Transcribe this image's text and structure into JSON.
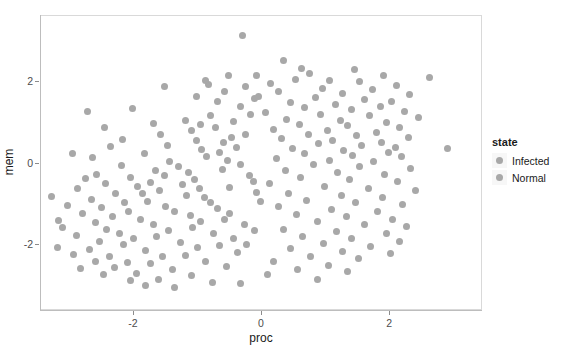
{
  "chart_data": {
    "type": "scatter",
    "title": "",
    "xlabel": "proc",
    "ylabel": "mem",
    "xlim": [
      -3.45,
      3.45
    ],
    "ylim": [
      -3.6,
      3.6
    ],
    "xticks": [
      -2,
      0,
      2
    ],
    "xticklabels": [
      "-2",
      "0",
      "2"
    ],
    "yticks": [
      -2,
      0,
      2
    ],
    "yticklabels": [
      "-2",
      "0",
      "2"
    ],
    "grid": false,
    "legend": {
      "title": "state",
      "position": "right",
      "entries": [
        {
          "label": "Infected",
          "color": "#a8a8a8"
        },
        {
          "label": "Normal",
          "color": "#a8a8a8"
        }
      ]
    },
    "point_color": "#a8a8a8",
    "point_radius_px": 3.5,
    "series": [
      {
        "name": "Infected",
        "color": "#a8a8a8",
        "points": [
          [
            -0.3,
            3.12
          ],
          [
            0.33,
            2.52
          ],
          [
            0.62,
            2.33
          ],
          [
            1.45,
            2.3
          ],
          [
            0.74,
            2.2
          ],
          [
            1.9,
            2.16
          ],
          [
            -0.52,
            2.14
          ],
          [
            2.62,
            2.09
          ],
          [
            0.53,
            2.05
          ],
          [
            1.05,
            2.02
          ],
          [
            1.52,
            1.99
          ],
          [
            0.14,
            1.96
          ],
          [
            -0.84,
            1.93
          ],
          [
            2.1,
            1.9
          ],
          [
            0.95,
            1.84
          ],
          [
            1.72,
            1.8
          ],
          [
            0.26,
            1.76
          ],
          [
            1.26,
            1.72
          ],
          [
            2.3,
            1.69
          ],
          [
            -0.05,
            1.64
          ],
          [
            0.84,
            1.6
          ],
          [
            1.6,
            1.57
          ],
          [
            2.02,
            1.52
          ],
          [
            0.45,
            1.48
          ],
          [
            1.14,
            1.44
          ],
          [
            1.85,
            1.4
          ],
          [
            0.66,
            1.36
          ],
          [
            1.4,
            1.31
          ],
          [
            2.22,
            1.28
          ],
          [
            0.05,
            1.24
          ],
          [
            0.92,
            1.2
          ],
          [
            1.68,
            1.16
          ],
          [
            2.45,
            1.12
          ],
          [
            0.38,
            1.08
          ],
          [
            1.22,
            1.04
          ],
          [
            1.95,
            1.0
          ],
          [
            0.58,
            0.96
          ],
          [
            1.34,
            0.92
          ],
          [
            2.14,
            0.88
          ],
          [
            0.18,
            0.84
          ],
          [
            1.02,
            0.8
          ],
          [
            1.78,
            0.76
          ],
          [
            0.72,
            0.72
          ],
          [
            1.48,
            0.68
          ],
          [
            2.28,
            0.64
          ],
          [
            0.3,
            0.6
          ],
          [
            1.1,
            0.56
          ],
          [
            1.86,
            0.52
          ],
          [
            0.88,
            0.48
          ],
          [
            1.56,
            0.44
          ],
          [
            2.08,
            0.4
          ],
          [
            0.48,
            0.36
          ],
          [
            1.28,
            0.32
          ],
          [
            1.98,
            0.28
          ],
          [
            0.66,
            0.24
          ],
          [
            1.42,
            0.2
          ],
          [
            2.18,
            0.16
          ],
          [
            0.22,
            0.12
          ],
          [
            1.06,
            0.08
          ],
          [
            1.74,
            0.04
          ],
          [
            2.9,
            0.36
          ],
          [
            0.8,
            -0.02
          ],
          [
            1.52,
            -0.08
          ],
          [
            2.32,
            -0.12
          ],
          [
            0.36,
            -0.18
          ],
          [
            1.18,
            -0.22
          ],
          [
            1.92,
            -0.28
          ],
          [
            0.6,
            -0.34
          ],
          [
            1.36,
            -0.4
          ],
          [
            2.12,
            -0.44
          ],
          [
            0.12,
            -0.5
          ],
          [
            0.98,
            -0.56
          ],
          [
            1.66,
            -0.6
          ],
          [
            2.4,
            -0.66
          ],
          [
            0.42,
            -0.72
          ],
          [
            1.24,
            -0.78
          ],
          [
            1.88,
            -0.84
          ],
          [
            0.7,
            -0.9
          ],
          [
            1.46,
            -0.94
          ],
          [
            2.2,
            -1.0
          ],
          [
            0.26,
            -1.06
          ],
          [
            1.08,
            -1.12
          ],
          [
            1.8,
            -1.18
          ],
          [
            0.54,
            -1.24
          ],
          [
            1.32,
            -1.3
          ],
          [
            2.04,
            -1.36
          ],
          [
            0.86,
            -1.42
          ],
          [
            1.6,
            -1.48
          ],
          [
            2.26,
            -1.54
          ],
          [
            0.34,
            -1.6
          ],
          [
            1.16,
            -1.66
          ],
          [
            1.94,
            -1.72
          ],
          [
            0.64,
            -1.78
          ],
          [
            1.4,
            -1.84
          ],
          [
            2.14,
            -1.9
          ],
          [
            0.96,
            -1.96
          ],
          [
            1.7,
            -2.02
          ],
          [
            0.44,
            -2.08
          ],
          [
            1.26,
            -2.14
          ],
          [
            2.0,
            -2.2
          ],
          [
            0.76,
            -2.26
          ],
          [
            1.5,
            -2.32
          ],
          [
            0.18,
            -2.4
          ],
          [
            1.04,
            -2.48
          ],
          [
            0.56,
            -2.58
          ],
          [
            1.34,
            -2.64
          ],
          [
            0.08,
            -2.72
          ],
          [
            0.86,
            -2.84
          ]
        ]
      },
      {
        "name": "Normal",
        "color": "#a8a8a8",
        "points": [
          [
            -2.72,
            1.28
          ],
          [
            -2.02,
            1.34
          ],
          [
            -1.58,
            0.72
          ],
          [
            -2.36,
            0.42
          ],
          [
            -1.2,
            1.06
          ],
          [
            -2.58,
            -0.26
          ],
          [
            -1.84,
            0.24
          ],
          [
            -1.02,
            0.56
          ],
          [
            -2.2,
            -0.04
          ],
          [
            -1.44,
            0.06
          ],
          [
            -0.72,
            0.88
          ],
          [
            -2.88,
            -0.62
          ],
          [
            -1.66,
            -0.18
          ],
          [
            -0.94,
            0.34
          ],
          [
            -2.44,
            -0.48
          ],
          [
            -1.3,
            -0.08
          ],
          [
            -0.6,
            0.52
          ],
          [
            -2.06,
            -0.34
          ],
          [
            -1.52,
            -0.3
          ],
          [
            -0.86,
            0.16
          ],
          [
            -2.66,
            -0.88
          ],
          [
            -1.94,
            -0.56
          ],
          [
            -1.14,
            -0.22
          ],
          [
            -0.48,
            0.64
          ],
          [
            -2.28,
            -0.72
          ],
          [
            -1.74,
            -0.46
          ],
          [
            -1.06,
            -0.38
          ],
          [
            -0.66,
            0.28
          ],
          [
            -3.04,
            -1.02
          ],
          [
            -2.5,
            -1.08
          ],
          [
            -1.86,
            -0.74
          ],
          [
            -1.24,
            -0.52
          ],
          [
            -0.54,
            0.08
          ],
          [
            -2.14,
            -0.96
          ],
          [
            -1.6,
            -0.66
          ],
          [
            -0.98,
            -0.6
          ],
          [
            -0.4,
            0.4
          ],
          [
            -2.8,
            -1.22
          ],
          [
            -2.34,
            -1.3
          ],
          [
            -1.78,
            -0.92
          ],
          [
            -1.18,
            -0.78
          ],
          [
            -0.62,
            -0.14
          ],
          [
            -0.26,
            0.72
          ],
          [
            -2.6,
            -1.44
          ],
          [
            -2.08,
            -1.18
          ],
          [
            -1.5,
            -1.04
          ],
          [
            -0.9,
            -0.84
          ],
          [
            -0.34,
            -0.02
          ],
          [
            -3.12,
            -1.56
          ],
          [
            -2.42,
            -1.62
          ],
          [
            -1.9,
            -1.36
          ],
          [
            -1.36,
            -1.16
          ],
          [
            -0.8,
            -0.96
          ],
          [
            -0.2,
            -0.3
          ],
          [
            -2.9,
            -1.76
          ],
          [
            -2.22,
            -1.72
          ],
          [
            -1.7,
            -1.5
          ],
          [
            -1.12,
            -1.28
          ],
          [
            -0.7,
            -1.1
          ],
          [
            -0.14,
            -0.44
          ],
          [
            -2.54,
            -1.9
          ],
          [
            -2.0,
            -1.84
          ],
          [
            -1.46,
            -1.64
          ],
          [
            -0.96,
            -1.42
          ],
          [
            -0.5,
            -1.22
          ],
          [
            -0.08,
            -0.7
          ],
          [
            -3.2,
            -2.04
          ],
          [
            -2.7,
            -2.1
          ],
          [
            -2.16,
            -1.98
          ],
          [
            -1.64,
            -1.78
          ],
          [
            -1.08,
            -1.56
          ],
          [
            -0.58,
            -1.36
          ],
          [
            -0.02,
            -0.92
          ],
          [
            -2.94,
            -2.22
          ],
          [
            -2.38,
            -2.26
          ],
          [
            -1.82,
            -2.12
          ],
          [
            -1.28,
            -1.92
          ],
          [
            -0.76,
            -1.7
          ],
          [
            -0.28,
            -1.5
          ],
          [
            -2.6,
            -2.38
          ],
          [
            -2.1,
            -2.42
          ],
          [
            -1.56,
            -2.28
          ],
          [
            -1.0,
            -2.06
          ],
          [
            -0.44,
            -1.84
          ],
          [
            -0.12,
            -1.64
          ],
          [
            -2.84,
            -2.56
          ],
          [
            -2.3,
            -2.54
          ],
          [
            -1.74,
            -2.44
          ],
          [
            -1.2,
            -2.24
          ],
          [
            -0.66,
            -2.0
          ],
          [
            -0.24,
            -1.98
          ],
          [
            -2.48,
            -2.7
          ],
          [
            -1.96,
            -2.68
          ],
          [
            -1.4,
            -2.58
          ],
          [
            -0.88,
            -2.4
          ],
          [
            -0.38,
            -2.18
          ],
          [
            -2.06,
            -2.86
          ],
          [
            -1.62,
            -2.82
          ],
          [
            -1.1,
            -2.74
          ],
          [
            -0.56,
            -2.52
          ],
          [
            -1.36,
            -3.02
          ],
          [
            -0.78,
            -2.9
          ],
          [
            -1.82,
            -2.98
          ],
          [
            -3.28,
            -0.8
          ],
          [
            -3.18,
            -1.4
          ],
          [
            -2.76,
            -0.36
          ],
          [
            -1.48,
            0.44
          ],
          [
            -2.64,
            0.14
          ],
          [
            -0.96,
            0.96
          ],
          [
            -1.1,
            0.8
          ],
          [
            -2.18,
            0.58
          ],
          [
            -0.8,
            1.18
          ],
          [
            -0.44,
            1.02
          ],
          [
            -0.18,
            1.2
          ],
          [
            -0.34,
            1.4
          ],
          [
            -0.7,
            1.52
          ],
          [
            -1.02,
            1.64
          ],
          [
            -0.12,
            1.58
          ],
          [
            -0.58,
            1.76
          ],
          [
            -0.26,
            1.88
          ],
          [
            -1.52,
            1.88
          ],
          [
            -0.88,
            2.02
          ],
          [
            -0.08,
            2.14
          ],
          [
            -2.46,
            0.88
          ],
          [
            -0.34,
            -2.92
          ],
          [
            -2.96,
            0.24
          ],
          [
            -1.7,
            0.98
          ],
          [
            -0.5,
            -0.58
          ]
        ]
      }
    ]
  }
}
